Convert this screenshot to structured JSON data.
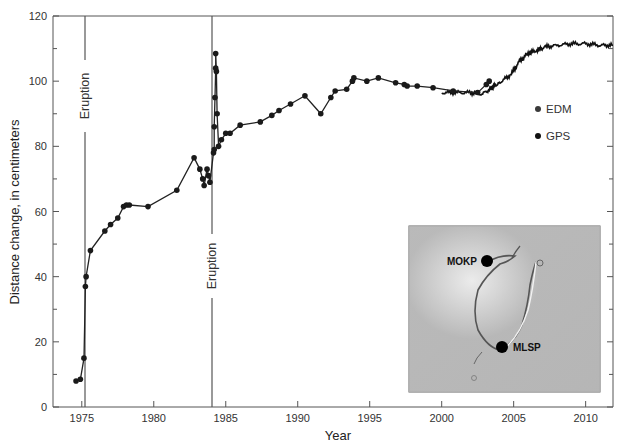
{
  "chart_data": {
    "type": "line",
    "title": "",
    "xlabel": "Year",
    "ylabel": "Distance change, in centimeters",
    "xlim": [
      1973.0,
      2011.9
    ],
    "ylim": [
      0,
      120
    ],
    "xticks": [
      1975,
      1980,
      1985,
      1990,
      1995,
      2000,
      2005,
      2010
    ],
    "yticks": [
      0,
      20,
      40,
      60,
      80,
      100,
      120
    ],
    "grid": false,
    "legend": {
      "position": "right",
      "entries": [
        "EDM",
        "GPS"
      ]
    },
    "annotations": [
      {
        "text": "Eruption",
        "x": 1975.2,
        "orientation": "vertical"
      },
      {
        "text": "Eruption",
        "x": 1984.1,
        "orientation": "vertical"
      }
    ],
    "series": [
      {
        "name": "EDM",
        "marker": "circle",
        "x": [
          1974.6,
          1974.9,
          1975.15,
          1975.25,
          1975.3,
          1975.6,
          1976.6,
          1977.0,
          1977.5,
          1977.9,
          1978.1,
          1978.3,
          1979.6,
          1981.6,
          1982.8,
          1983.2,
          1983.4,
          1983.5,
          1983.7,
          1983.8,
          1983.9,
          1984.15,
          1984.2,
          1984.2,
          1984.25,
          1984.3,
          1984.3,
          1984.35,
          1984.4,
          1984.5,
          1984.7,
          1985.0,
          1985.3,
          1986.0,
          1987.4,
          1988.2,
          1988.7,
          1989.5,
          1990.5,
          1991.6,
          1992.3,
          1992.6,
          1993.4,
          1993.8,
          1993.9,
          1994.8,
          1995.6,
          1996.8,
          1997.4,
          1997.6,
          1998.3,
          1999.4,
          2000.8,
          2002.5,
          2003.1,
          2003.3
        ],
        "values": [
          8,
          8.5,
          15,
          37,
          40,
          48,
          54,
          56,
          58,
          61.5,
          62,
          62,
          61.5,
          66.5,
          76.5,
          73,
          70,
          68,
          73,
          71,
          69,
          78,
          79,
          86,
          95,
          104,
          108.5,
          103,
          90,
          80,
          82,
          84,
          84,
          86.5,
          87.5,
          89.5,
          91,
          93,
          95.5,
          90,
          95,
          97,
          97.5,
          100,
          101,
          100,
          101,
          99.5,
          99,
          98.5,
          98.5,
          98,
          97,
          96.5,
          99,
          100
        ]
      },
      {
        "name": "GPS",
        "marker": "line",
        "x": [
          2000.0,
          2001.0,
          2002.0,
          2002.8,
          2003.5,
          2004.0,
          2004.8,
          2005.4,
          2006.0,
          2006.6,
          2007.2,
          2008.0,
          2009.0,
          2010.0,
          2011.0,
          2011.9
        ],
        "values": [
          96.5,
          96.5,
          96.5,
          96,
          98,
          99.5,
          102,
          106,
          108.5,
          109.5,
          110.5,
          111,
          111.5,
          111.5,
          111,
          111
        ]
      }
    ]
  },
  "legend": {
    "edm_label": "EDM",
    "gps_label": "GPS",
    "edm_color": "#3a3a3a",
    "gps_color": "#111111"
  },
  "annotations": {
    "eruption_1": "Eruption",
    "eruption_2": "Eruption"
  },
  "axes": {
    "xlabel": "Year",
    "ylabel": "Distance change, in centimeters"
  },
  "inset": {
    "station_1": "MOKP",
    "station_2": "MLSP"
  }
}
